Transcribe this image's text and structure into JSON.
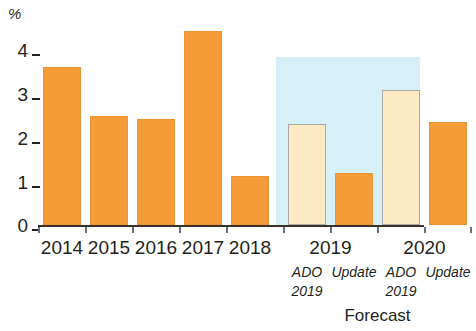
{
  "chart_data": {
    "type": "bar",
    "title": "",
    "subtitle": "",
    "xlabel": "",
    "ylabel": "%",
    "ylim": [
      0,
      4
    ],
    "yticks": [
      0,
      1,
      2,
      3,
      4
    ],
    "ytick_labels": [
      "0",
      "1",
      "2",
      "3",
      "4"
    ],
    "grid": false,
    "legend": null,
    "categories": [
      "2014",
      "2015",
      "2016",
      "2017",
      "2018",
      "2019",
      "2020"
    ],
    "bars": [
      {
        "category": "2014",
        "sublabel": "",
        "value": 3.05,
        "style": "solid"
      },
      {
        "category": "2015",
        "sublabel": "",
        "value": 2.1,
        "style": "solid"
      },
      {
        "category": "2016",
        "sublabel": "",
        "value": 2.05,
        "style": "solid"
      },
      {
        "category": "2017",
        "sublabel": "",
        "value": 3.75,
        "style": "solid"
      },
      {
        "category": "2018",
        "sublabel": "",
        "value": 0.95,
        "style": "solid"
      },
      {
        "category": "2019",
        "sublabel": "ADO 2019",
        "value": 1.95,
        "style": "hollow"
      },
      {
        "category": "2019",
        "sublabel": "Update",
        "value": 1.0,
        "style": "solid"
      },
      {
        "category": "2020",
        "sublabel": "ADO 2019",
        "value": 2.6,
        "style": "hollow"
      },
      {
        "category": "2020",
        "sublabel": "Update",
        "value": 2.0,
        "style": "solid"
      }
    ],
    "annotations": {
      "forecast_caption": "Forecast",
      "forecast_region_start_category": "2019",
      "sub_ado_label": "ADO",
      "sub_update_label": "Update",
      "sub_year_label": "2019"
    },
    "colors": {
      "actual_bar": "#f59b38",
      "forecast_ado_bar": "#fdeac4",
      "forecast_band": "#d6f0f7",
      "axis": "#3a3226",
      "text": "#231f20"
    }
  },
  "axis": {
    "unit_label": "%",
    "ticks": [
      "4",
      "3",
      "2",
      "1",
      "0"
    ]
  },
  "xlabels": {
    "groups": [
      {
        "text": "2014"
      },
      {
        "text": "2015"
      },
      {
        "text": "2016"
      },
      {
        "text": "2017"
      },
      {
        "text": "2018"
      },
      {
        "text": "2019"
      },
      {
        "text": "2020"
      }
    ],
    "sub_row1": [
      {
        "text": "ADO"
      },
      {
        "text": "Update"
      },
      {
        "text": "ADO"
      },
      {
        "text": "Update"
      }
    ],
    "sub_row2": [
      {
        "text": "2019"
      },
      {
        "text": "2019"
      }
    ],
    "forecast_caption": "Forecast"
  }
}
